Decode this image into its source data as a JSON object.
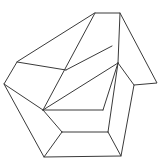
{
  "canvas": {
    "width": 165,
    "height": 162,
    "background_color": "#ffffff",
    "alt_text": "Impossible figure line drawing"
  },
  "drawing": {
    "title": "Impossible Figure",
    "style": "wireframe line drawing",
    "stroke_color": "#3a3a3a",
    "fill_color": "#ffffff",
    "stroke_width": 1
  },
  "chart_data": {
    "type": "line",
    "title": "Impossible Figure",
    "xlabel": "",
    "ylabel": "",
    "xlim": [
      0,
      165
    ],
    "ylim": [
      0,
      162
    ],
    "grid": false,
    "legend": "none",
    "vertices": {
      "top_left": [
        95,
        13
      ],
      "top_right": [
        120,
        13
      ],
      "left_upper": [
        17,
        62
      ],
      "left_outer": [
        4,
        84
      ],
      "right_inner": [
        134,
        85
      ],
      "right_outer": [
        157,
        83
      ],
      "bottom_left": [
        44,
        157
      ],
      "bottom_right": [
        121,
        156
      ],
      "center_junction": [
        118,
        63
      ],
      "mid_left_junction": [
        43,
        110
      ],
      "inner_right_upper": [
        103,
        110
      ],
      "inner_right_lower": [
        108,
        132
      ],
      "inner_left_lower": [
        62,
        132
      ],
      "band_left_top": [
        66,
        70
      ],
      "band_right_top": [
        112,
        46
      ]
    },
    "series": [
      {
        "name": "outer-silhouette",
        "points": [
          [
            95,
            13
          ],
          [
            120,
            13
          ],
          [
            157,
            83
          ],
          [
            134,
            85
          ],
          [
            121,
            156
          ],
          [
            44,
            157
          ],
          [
            4,
            84
          ],
          [
            17,
            62
          ],
          [
            95,
            13
          ]
        ]
      },
      {
        "name": "upper-arm-left-edge",
        "points": [
          [
            95,
            13
          ],
          [
            43,
            110
          ]
        ]
      },
      {
        "name": "upper-arm-right-edge",
        "points": [
          [
            120,
            13
          ],
          [
            118,
            63
          ]
        ]
      },
      {
        "name": "diagonal-band-upper",
        "points": [
          [
            66,
            70
          ],
          [
            112,
            46
          ]
        ]
      },
      {
        "name": "diagonal-band-lower",
        "points": [
          [
            43,
            110
          ],
          [
            118,
            63
          ]
        ]
      },
      {
        "name": "center-to-right-inner",
        "points": [
          [
            118,
            63
          ],
          [
            134,
            85
          ]
        ]
      },
      {
        "name": "center-to-inner-lower",
        "points": [
          [
            118,
            63
          ],
          [
            108,
            132
          ]
        ]
      },
      {
        "name": "inner-shelf-upper",
        "points": [
          [
            43,
            110
          ],
          [
            103,
            110
          ]
        ]
      },
      {
        "name": "inner-shelf-upper-riser",
        "points": [
          [
            103,
            110
          ],
          [
            118,
            63
          ]
        ]
      },
      {
        "name": "inner-shelf-lower",
        "points": [
          [
            62,
            132
          ],
          [
            108,
            132
          ]
        ]
      },
      {
        "name": "inner-left-riser",
        "points": [
          [
            43,
            110
          ],
          [
            62,
            132
          ]
        ]
      },
      {
        "name": "bottom-left-riser",
        "points": [
          [
            62,
            132
          ],
          [
            44,
            157
          ]
        ]
      },
      {
        "name": "bottom-right-riser",
        "points": [
          [
            108,
            132
          ],
          [
            121,
            156
          ]
        ]
      },
      {
        "name": "left-upper-to-band",
        "points": [
          [
            17,
            62
          ],
          [
            66,
            70
          ]
        ]
      },
      {
        "name": "left-outer-to-mid",
        "points": [
          [
            4,
            84
          ],
          [
            43,
            110
          ]
        ]
      }
    ]
  }
}
